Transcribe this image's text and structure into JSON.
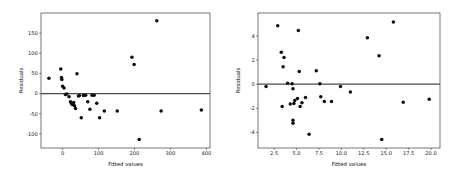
{
  "figure": {
    "background_color": "#ffffff",
    "point_color": "#0d0d0d",
    "axis_color": "#555555",
    "zero_line_color": "#4a4a4a"
  },
  "chart_data": [
    {
      "type": "scatter",
      "title": "",
      "subtitle": "",
      "xlabel": "Fitted values",
      "ylabel": "Residuals",
      "grid": false,
      "legend": false,
      "legend_position": "none",
      "xlim": [
        -60,
        410
      ],
      "ylim": [
        -135,
        200
      ],
      "xticks": [
        0,
        100,
        200,
        300,
        400
      ],
      "xticklabels": [
        "0",
        "100",
        "200",
        "300",
        "400"
      ],
      "yticks": [
        -100,
        -50,
        0,
        50,
        100,
        150
      ],
      "yticklabels": [
        "-100",
        "-50",
        "0",
        "50",
        "100",
        "150"
      ],
      "annotations": [
        {
          "text": "horizontal reference line at y = 0"
        }
      ],
      "x": [
        -38,
        -5,
        -3,
        -2,
        0,
        4,
        8,
        12,
        18,
        22,
        24,
        26,
        27,
        29,
        31,
        33,
        36,
        40,
        44,
        47,
        52,
        58,
        64,
        70,
        76,
        82,
        88,
        95,
        103,
        116,
        152,
        193,
        199,
        213,
        262,
        274,
        386
      ],
      "y": [
        38,
        61,
        40,
        35,
        18,
        14,
        -2,
        -1,
        -8,
        -20,
        -23,
        -26,
        -27,
        -25,
        -22,
        -30,
        -37,
        49,
        -6,
        -5,
        -60,
        -5,
        -4,
        -20,
        -39,
        -4,
        -4,
        -24,
        -60,
        -43,
        -43,
        90,
        72,
        -114,
        181,
        -43,
        -41
      ]
    },
    {
      "type": "scatter",
      "title": "",
      "subtitle": "",
      "xlabel": "Fitted values",
      "ylabel": "Residuals",
      "grid": false,
      "legend": false,
      "legend_position": "none",
      "xlim": [
        0.7,
        21.0
      ],
      "ylim": [
        -5.3,
        5.9
      ],
      "xticks": [
        2.5,
        5.0,
        7.5,
        10.0,
        12.5,
        15.0,
        17.5,
        20.0
      ],
      "xticklabels": [
        "2.5",
        "5.0",
        "7.5",
        "10.0",
        "12.5",
        "15.0",
        "17.5",
        "20.0"
      ],
      "yticks": [
        -4,
        -2,
        0,
        2,
        4
      ],
      "yticklabels": [
        "-4",
        "-2",
        "0",
        "2",
        "4"
      ],
      "annotations": [
        {
          "text": "horizontal reference line at y = 0"
        }
      ],
      "x": [
        1.6,
        2.9,
        3.3,
        3.4,
        3.5,
        3.6,
        4.0,
        4.3,
        4.5,
        4.6,
        4.6,
        4.6,
        4.7,
        4.8,
        5.1,
        5.2,
        5.3,
        5.4,
        5.6,
        6.0,
        6.4,
        7.2,
        7.6,
        7.7,
        8.1,
        8.9,
        9.9,
        11.0,
        12.9,
        14.2,
        14.5,
        15.8,
        16.9,
        19.8
      ],
      "y": [
        -0.2,
        4.85,
        2.65,
        -1.85,
        1.45,
        2.2,
        0.08,
        -1.65,
        0.04,
        -0.38,
        -3.0,
        -3.25,
        -1.6,
        -1.35,
        -1.2,
        4.45,
        1.05,
        -1.85,
        -1.55,
        -1.1,
        -4.15,
        1.1,
        0.03,
        -1.05,
        -1.45,
        -1.45,
        -0.2,
        -0.65,
        3.85,
        2.35,
        -4.6,
        5.15,
        -1.5,
        -1.25
      ]
    }
  ]
}
